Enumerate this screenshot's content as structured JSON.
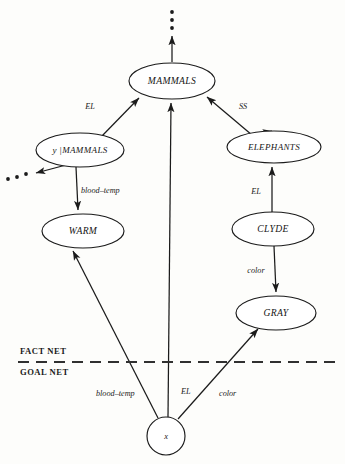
{
  "figure": {
    "type": "semantic-network-diagram",
    "background_color": "#fdfdfb",
    "ink_color": "#1b1b1b"
  },
  "nodes": {
    "mammals": {
      "label": "MAMMALS",
      "cx": 172,
      "cy": 81,
      "rx": 43,
      "ry": 18
    },
    "y_mammals": {
      "label": "y |MAMMALS",
      "cx": 80,
      "cy": 150,
      "rx": 44,
      "ry": 17
    },
    "elephants": {
      "label": "ELEPHANTS",
      "cx": 274,
      "cy": 147,
      "rx": 47,
      "ry": 16
    },
    "warm": {
      "label": "WARM",
      "cx": 83,
      "cy": 231,
      "rx": 41,
      "ry": 17
    },
    "clyde": {
      "label": "CLYDE",
      "cx": 273,
      "cy": 229,
      "rx": 41,
      "ry": 17
    },
    "gray": {
      "label": "GRAY",
      "cx": 276,
      "cy": 313,
      "rx": 40,
      "ry": 17
    },
    "goal_var": {
      "label": "x",
      "cx": 166,
      "cy": 436,
      "r": 19
    }
  },
  "edges": [
    {
      "id": "y-mammals-to-mammals",
      "label": "EL",
      "label_x": 98,
      "label_y": 107,
      "from": "y_mammals",
      "to": "mammals"
    },
    {
      "id": "elephants-to-mammals",
      "label": "SS",
      "label_x": 240,
      "label_y": 107,
      "from": "elephants",
      "to": "mammals"
    },
    {
      "id": "y-mammals-to-warm",
      "label": "blood–temp",
      "label_x": 79,
      "label_y": 191,
      "from": "y_mammals",
      "to": "warm"
    },
    {
      "id": "clyde-to-elephants",
      "label": "EL",
      "label_x": 249,
      "label_y": 192,
      "from": "clyde",
      "to": "elephants"
    },
    {
      "id": "clyde-to-gray",
      "label": "color",
      "label_x": 243,
      "label_y": 271,
      "from": "clyde",
      "to": "gray"
    },
    {
      "id": "x-to-warm",
      "label": "blood–temp",
      "label_x": 96,
      "label_y": 394,
      "from": "goal_var",
      "to": "warm"
    },
    {
      "id": "x-to-mammals",
      "label": "EL",
      "label_x": 181,
      "label_y": 392,
      "from": "goal_var",
      "to": "mammals"
    },
    {
      "id": "x-to-gray",
      "label": "color",
      "label_x": 219,
      "label_y": 394,
      "from": "goal_var",
      "to": "gray"
    }
  ],
  "partition": {
    "upper_label": "FACT NET",
    "lower_label": "GOAL NET",
    "upper_label_x": 20,
    "upper_label_y": 352,
    "lower_label_x": 20,
    "lower_label_y": 373,
    "line_y": 362,
    "line_x1": 18,
    "line_x2": 342
  },
  "ellipsis": {
    "top": {
      "name": "top-continuation-dots",
      "dots": [
        [
          172,
          12
        ],
        [
          172,
          20
        ],
        [
          172,
          28
        ]
      ]
    },
    "left": {
      "name": "left-continuation-dots",
      "dots": [
        [
          8,
          179
        ],
        [
          17,
          177
        ],
        [
          26,
          174
        ]
      ]
    }
  }
}
